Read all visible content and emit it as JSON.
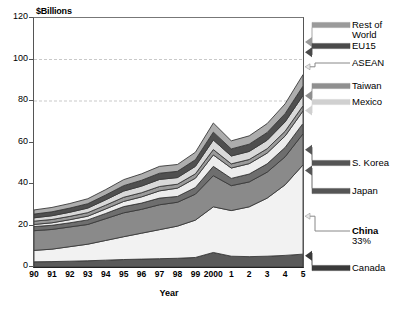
{
  "chart_data": {
    "type": "area",
    "stacked": true,
    "title": "",
    "axis_unit_label": "$Billions",
    "xlabel": "Year",
    "ylabel": "",
    "categories": [
      "90",
      "91",
      "92",
      "93",
      "94",
      "95",
      "96",
      "97",
      "98",
      "99",
      "2000",
      "1",
      "2",
      "3",
      "4",
      "5"
    ],
    "x_tick_labels": [
      "90",
      "91",
      "92",
      "93",
      "94",
      "95",
      "96",
      "97",
      "98",
      "99",
      "2000",
      "1",
      "2",
      "3",
      "4",
      "5"
    ],
    "y_tick_labels": [
      "0",
      "20",
      "40",
      "60",
      "80",
      "100",
      "120"
    ],
    "ylim": [
      0,
      120
    ],
    "grid": "dashed horizontal at 80 and 100",
    "legend_position": "right-side arrow callouts",
    "series": [
      {
        "name": "Canada",
        "color": "#5a5a5a",
        "values": [
          2.5,
          2.6,
          2.8,
          3.0,
          3.3,
          3.6,
          3.8,
          4.0,
          4.2,
          4.6,
          7.0,
          5.2,
          5.0,
          5.2,
          5.6,
          6.2
        ]
      },
      {
        "name": "China",
        "color": "#f2f2f2",
        "values": [
          5.5,
          6.0,
          7.0,
          8.0,
          9.5,
          11.0,
          12.5,
          14.0,
          15.5,
          18.0,
          22.0,
          22.0,
          24.0,
          28.0,
          34.0,
          43.0
        ]
      },
      {
        "name": "Japan",
        "color": "#8a8a8a",
        "values": [
          9.5,
          9.5,
          9.5,
          9.5,
          10.5,
          11.5,
          11.5,
          12.0,
          11.5,
          12.5,
          15.0,
          12.0,
          12.0,
          12.5,
          13.5,
          15.0
        ]
      },
      {
        "name": "S. Korea",
        "color": "#6e6e6e",
        "values": [
          2.0,
          2.0,
          2.0,
          2.2,
          2.5,
          3.0,
          3.0,
          3.2,
          2.8,
          3.2,
          4.5,
          3.5,
          3.8,
          4.0,
          4.5,
          5.0
        ]
      },
      {
        "name": "Mexico",
        "color": "#ededed",
        "values": [
          1.0,
          1.2,
          1.5,
          1.8,
          2.2,
          2.5,
          3.0,
          3.5,
          4.0,
          4.5,
          5.5,
          5.0,
          5.0,
          5.2,
          5.5,
          6.0
        ]
      },
      {
        "name": "Taiwan",
        "color": "#9a9a9a",
        "values": [
          1.6,
          1.6,
          1.6,
          1.7,
          1.8,
          2.0,
          2.0,
          2.1,
          1.9,
          2.1,
          2.6,
          2.0,
          2.0,
          2.1,
          2.3,
          2.5
        ]
      },
      {
        "name": "ASEAN",
        "color": "#d9d9d9",
        "values": [
          1.6,
          1.8,
          2.0,
          2.2,
          2.6,
          3.0,
          3.2,
          3.4,
          3.2,
          3.6,
          4.6,
          3.8,
          3.9,
          4.1,
          4.5,
          5.0
        ]
      },
      {
        "name": "EU15",
        "color": "#4f4f4f",
        "values": [
          1.8,
          1.9,
          2.0,
          2.1,
          2.3,
          2.6,
          2.8,
          3.0,
          3.0,
          3.2,
          3.8,
          3.4,
          3.5,
          3.7,
          4.0,
          4.5
        ]
      },
      {
        "name": "Rest of World",
        "color": "#adadad",
        "values": [
          2.0,
          2.1,
          2.2,
          2.4,
          2.6,
          2.9,
          3.1,
          3.3,
          3.3,
          3.6,
          4.4,
          3.9,
          4.0,
          4.3,
          4.7,
          5.5
        ]
      }
    ],
    "annotations": [
      {
        "label": "Rest of",
        "sublabel": "World"
      },
      {
        "label": "EU15"
      },
      {
        "label": "ASEAN"
      },
      {
        "label": "Taiwan"
      },
      {
        "label": "Mexico"
      },
      {
        "label": "S. Korea"
      },
      {
        "label": "Japan"
      },
      {
        "label": "China",
        "sublabel": "33%",
        "bold": true
      },
      {
        "label": "Canada"
      }
    ]
  },
  "legend": {
    "rest_of_world_l1": "Rest of",
    "rest_of_world_l2": "World",
    "eu15": "EU15",
    "asean": "ASEAN",
    "taiwan": "Taiwan",
    "mexico": "Mexico",
    "skorea": "S. Korea",
    "japan": "Japan",
    "china": "China",
    "china_share": "33%",
    "canada": "Canada"
  }
}
